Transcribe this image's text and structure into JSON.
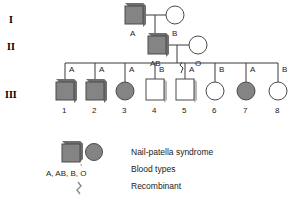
{
  "diagram": {
    "colors": {
      "affected_fill": "#848484",
      "unaffected_fill": "#ffffff",
      "stroke": "#4a4a4a",
      "line": "#3a3a3a",
      "shadow": "#6f6f6f",
      "text": "#1a1a1a"
    }
  },
  "generations": [
    {
      "label": "I"
    },
    {
      "label": "II"
    },
    {
      "label": "III"
    }
  ],
  "generation_1": [
    {
      "id": "I-1",
      "shape": "square",
      "affected": true,
      "blood_type": "A",
      "recombinant": false
    },
    {
      "id": "I-2",
      "shape": "circle",
      "affected": false,
      "blood_type": "B",
      "recombinant": false
    }
  ],
  "generation_2": [
    {
      "id": "II-1",
      "shape": "square",
      "affected": true,
      "blood_type": "AB",
      "recombinant": false
    },
    {
      "id": "II-2",
      "shape": "circle",
      "affected": false,
      "blood_type": "O",
      "recombinant": false
    }
  ],
  "generation_3": [
    {
      "id": "III-1",
      "number": "1",
      "shape": "square",
      "affected": true,
      "blood_type": "A",
      "recombinant": false
    },
    {
      "id": "III-2",
      "number": "2",
      "shape": "square",
      "affected": true,
      "blood_type": "A",
      "recombinant": false
    },
    {
      "id": "III-3",
      "number": "3",
      "shape": "circle",
      "affected": true,
      "blood_type": "A",
      "recombinant": false
    },
    {
      "id": "III-4",
      "number": "4",
      "shape": "square",
      "affected": false,
      "blood_type": "B",
      "recombinant": false
    },
    {
      "id": "III-5",
      "number": "5",
      "shape": "square",
      "affected": false,
      "blood_type": "A",
      "recombinant": true
    },
    {
      "id": "III-6",
      "number": "6",
      "shape": "circle",
      "affected": false,
      "blood_type": "B",
      "recombinant": false
    },
    {
      "id": "III-7",
      "number": "7",
      "shape": "circle",
      "affected": true,
      "blood_type": "A",
      "recombinant": false
    },
    {
      "id": "III-8",
      "number": "8",
      "shape": "circle",
      "affected": false,
      "blood_type": "B",
      "recombinant": false
    }
  ],
  "legend": {
    "symbols_row": {
      "square_name": "affected-square",
      "separator": ",",
      "circle_name": "affected-circle"
    },
    "blood_types_label": "A, AB, B, O",
    "entries": [
      {
        "key": "affected-symbols",
        "text": "Nail-patella syndrome"
      },
      {
        "key": "blood-types",
        "text": "Blood types"
      },
      {
        "key": "recombinant",
        "text": "Recombinant"
      }
    ]
  }
}
